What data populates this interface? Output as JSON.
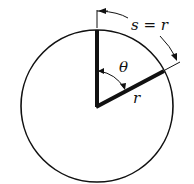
{
  "diagram": {
    "labels": {
      "arc": "s = r",
      "angle": "θ",
      "radius": "r"
    },
    "circle": {
      "cx": 97,
      "cy": 106,
      "r": 76
    },
    "colors": {
      "stroke": "#111111",
      "background": "#ffffff"
    }
  }
}
